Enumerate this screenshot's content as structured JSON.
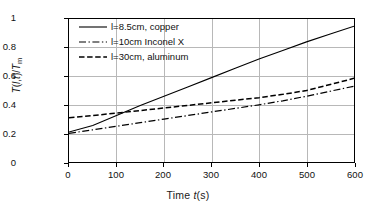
{
  "chart_data": {
    "type": "line",
    "title": "",
    "xlabel": "Time t(s)",
    "ylabel": "T(l,t)/Tm",
    "xlim": [
      0,
      600
    ],
    "ylim": [
      0,
      1
    ],
    "xticks": [
      "0",
      "100",
      "200",
      "300",
      "400",
      "500",
      "600"
    ],
    "yticks": [
      "0",
      "0.2",
      "0.4",
      "0.6",
      "0.8",
      "1"
    ],
    "grid": "both",
    "legend_position": "top-left-inside",
    "x": [
      0,
      50,
      100,
      150,
      200,
      250,
      300,
      350,
      400,
      450,
      500,
      550,
      600
    ],
    "series": [
      {
        "name": "l=8.5cm, copper",
        "style": "solid",
        "color": "#000000",
        "values": [
          0.21,
          0.255,
          0.325,
          0.395,
          0.46,
          0.525,
          0.59,
          0.655,
          0.72,
          0.78,
          0.84,
          0.895,
          0.95
        ]
      },
      {
        "name": "l=10cm Inconel X",
        "style": "dash-dot",
        "color": "#000000",
        "values": [
          0.2,
          0.225,
          0.25,
          0.275,
          0.3,
          0.325,
          0.35,
          0.375,
          0.4,
          0.428,
          0.46,
          0.495,
          0.53
        ]
      },
      {
        "name": "l=30cm, aluminum",
        "style": "dashed",
        "color": "#000000",
        "values": [
          0.31,
          0.325,
          0.342,
          0.36,
          0.378,
          0.396,
          0.414,
          0.432,
          0.45,
          0.473,
          0.5,
          0.542,
          0.585
        ]
      }
    ]
  },
  "axis": {
    "x_title_prefix": "Time ",
    "x_title_var": "t",
    "x_title_suffix": "(s)",
    "y_title_t1": "T",
    "y_title_open": "(",
    "y_title_l": "l",
    "y_title_comma": ",",
    "y_title_t2": "t",
    "y_title_close": ")/",
    "y_title_tm": "T",
    "y_title_sub": "m"
  },
  "legend": {
    "items": [
      {
        "label": "l=8.5cm, copper",
        "key": "solid-line-key"
      },
      {
        "label": "l=10cm Inconel X",
        "key": "dash-dot-line-key"
      },
      {
        "label": "l=30cm, aluminum",
        "key": "dashed-line-key"
      }
    ]
  }
}
